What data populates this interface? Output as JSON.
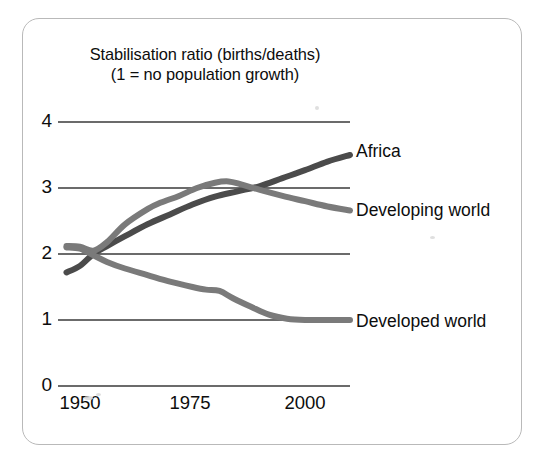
{
  "figure": {
    "background_color": "#ffffff",
    "frame_border_color": "#b9b9b9"
  },
  "chart_data": {
    "type": "line",
    "title": "Stabilisation ratio (births/deaths)",
    "subtitle": "(1 = no population growth)",
    "xlabel": "",
    "ylabel": "",
    "xlim": [
      1946,
      2012
    ],
    "ylim": [
      0,
      4
    ],
    "grid": true,
    "gridlines_y": [
      0,
      1,
      2,
      3,
      4
    ],
    "ytick_labels": [
      "4",
      "3",
      "2",
      "1",
      "0"
    ],
    "ytick_values": [
      4,
      3,
      2,
      1,
      0
    ],
    "xtick_labels": [
      "1950",
      "1975",
      "2000"
    ],
    "xtick_values": [
      1950,
      1975,
      2000
    ],
    "legend_position": "right-of-line-ends",
    "series": [
      {
        "name": "Africa",
        "color": "#4b4b4b",
        "label": "Africa",
        "x": [
          1947,
          1950,
          1953,
          1956,
          1960,
          1965,
          1970,
          1975,
          1980,
          1985,
          1990,
          1995,
          2000,
          2005,
          2010
        ],
        "values": [
          1.72,
          1.82,
          2.0,
          2.12,
          2.27,
          2.45,
          2.6,
          2.75,
          2.87,
          2.95,
          3.03,
          3.15,
          3.27,
          3.4,
          3.5
        ]
      },
      {
        "name": "Developing world",
        "color": "#7a7a7a",
        "label": "Developing world",
        "x": [
          1947,
          1950,
          1953,
          1956,
          1960,
          1965,
          1968,
          1972,
          1976,
          1980,
          1983,
          1986,
          1990,
          1995,
          2000,
          2005,
          2010
        ],
        "values": [
          2.12,
          2.11,
          2.05,
          2.18,
          2.45,
          2.68,
          2.78,
          2.88,
          3.0,
          3.08,
          3.1,
          3.05,
          2.97,
          2.88,
          2.8,
          2.72,
          2.66
        ]
      },
      {
        "name": "Developed world",
        "color": "#7a7a7a",
        "label": "Developed world",
        "x": [
          1947,
          1950,
          1953,
          1956,
          1960,
          1965,
          1970,
          1975,
          1978,
          1981,
          1984,
          1988,
          1992,
          1996,
          2000,
          2005,
          2010
        ],
        "values": [
          2.1,
          2.08,
          1.98,
          1.88,
          1.78,
          1.68,
          1.58,
          1.5,
          1.46,
          1.44,
          1.33,
          1.2,
          1.08,
          1.02,
          1.0,
          1.0,
          1.0
        ]
      }
    ]
  },
  "annotations": {
    "africa_label": "Africa",
    "developing_label": "Developing world",
    "developed_label": "Developed world"
  }
}
